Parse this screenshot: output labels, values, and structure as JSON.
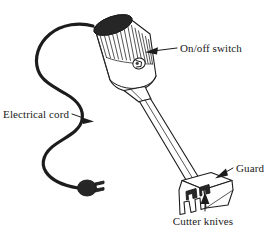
{
  "figure": {
    "style": "line-art technical illustration",
    "background_color": "#ffffff",
    "ink_color": "#1c1c1c"
  },
  "labels": {
    "on_off_switch": "On/off switch",
    "electrical_cord": "Electrical cord",
    "guard": "Guard",
    "cutter_knives": "Cutter knives"
  },
  "parts": [
    {
      "id": "on-off-switch",
      "name": "On/off switch",
      "arrow_direction": "left"
    },
    {
      "id": "electrical-cord",
      "name": "Electrical cord",
      "arrow_direction": "right"
    },
    {
      "id": "guard",
      "name": "Guard",
      "arrow_direction": "down-left"
    },
    {
      "id": "cutter-knives",
      "name": "Cutter knives",
      "arrow_direction": "up"
    }
  ]
}
